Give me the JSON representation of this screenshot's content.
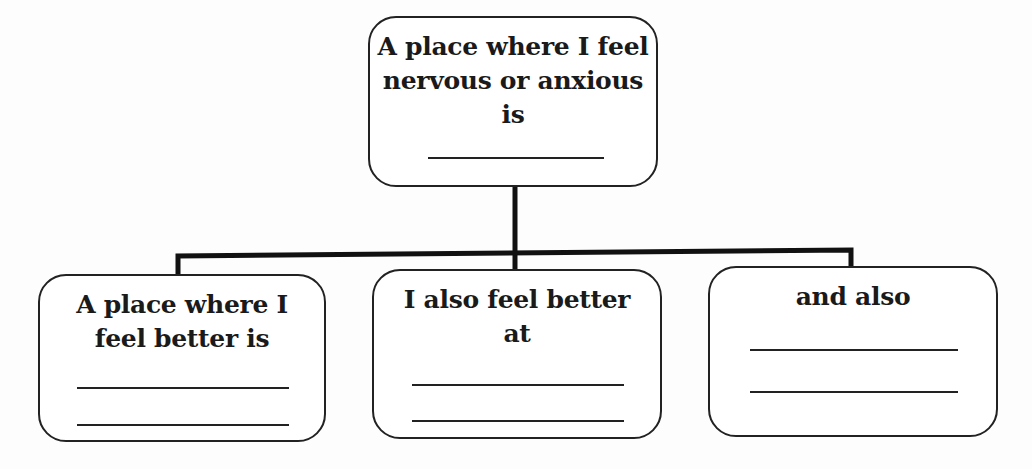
{
  "diagram": {
    "type": "tree-organizer",
    "root": {
      "label": "A place where I feel\nnervous or anxious\nis",
      "blank_lines": 1
    },
    "children": [
      {
        "label": "A place where I\nfeel better is",
        "blank_lines": 2
      },
      {
        "label": "I also feel better\nat",
        "blank_lines": 2
      },
      {
        "label": "and also",
        "blank_lines": 2
      }
    ],
    "colors": {
      "line": "#222222",
      "box_fill": "#ffffff",
      "background": "#fdfdfd"
    }
  }
}
